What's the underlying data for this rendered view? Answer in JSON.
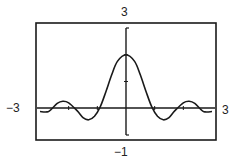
{
  "panel_label": ")",
  "window": {
    "xmin": "-3",
    "xmax": "3",
    "ymin": "-1",
    "ymax": "3"
  },
  "colors": {
    "ink": "#1a1a1a",
    "background": "#ffffff"
  },
  "chart_data": {
    "type": "line",
    "title": "",
    "xlabel": "",
    "ylabel": "",
    "xlim": [
      -3,
      3
    ],
    "ylim": [
      -1,
      3
    ],
    "grid": false,
    "legend": null,
    "tick_labels": {
      "x_left": "-3",
      "x_right": "3",
      "y_top": "3",
      "y_bottom": "-1"
    },
    "y_ticks": [
      1,
      2
    ],
    "series": [
      {
        "name": "f(x)",
        "description": "damped oscillation (scaled sinc-like), peak 2 at x=0",
        "x": [
          -3.0,
          -2.7,
          -2.4,
          -2.2,
          -2.0,
          -1.7,
          -1.5,
          -1.3,
          -1.1,
          -0.9,
          -0.7,
          -0.5,
          -0.3,
          0.0,
          0.3,
          0.5,
          0.7,
          0.9,
          1.1,
          1.3,
          1.5,
          1.7,
          2.0,
          2.2,
          2.4,
          2.7,
          3.0
        ],
        "y": [
          -0.12,
          -0.12,
          0.18,
          0.26,
          0.2,
          -0.1,
          -0.35,
          -0.43,
          -0.3,
          0.05,
          0.62,
          1.25,
          1.75,
          2.0,
          1.75,
          1.25,
          0.62,
          0.05,
          -0.3,
          -0.43,
          -0.35,
          -0.1,
          0.2,
          0.26,
          0.18,
          -0.12,
          -0.12
        ]
      }
    ]
  }
}
